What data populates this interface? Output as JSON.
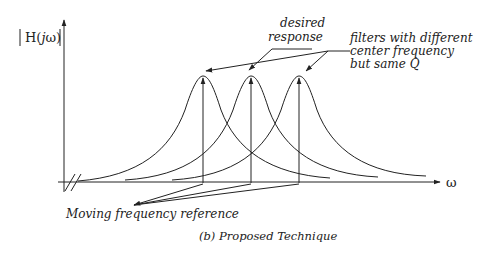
{
  "diagram": {
    "y_axis_label": "|H(jω)|",
    "y_axis_label_parts": {
      "open_bar": "|",
      "H": "H(",
      "j": "j",
      "omega_close": "ω)",
      "close_bar": "|"
    },
    "x_axis_label": "ω",
    "annotations": {
      "desired_response_line1": "desired",
      "desired_response_line2": "response",
      "filters_line1": "filters with different",
      "filters_line2": "center frequency",
      "filters_line3": "but same Q",
      "moving_reference": "Moving frequency reference"
    },
    "caption": "(b) Proposed Technique",
    "filters": [
      {
        "name": "filter-1",
        "center_x": 203
      },
      {
        "name": "filter-2",
        "center_x": 251
      },
      {
        "name": "filter-3",
        "center_x": 299
      }
    ],
    "colors": {
      "stroke": "#222222",
      "background": "#ffffff"
    }
  }
}
